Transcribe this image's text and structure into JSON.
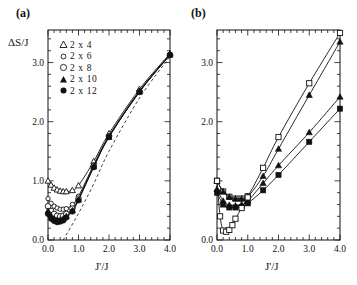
{
  "figure": {
    "background": "#ffffff",
    "ink": "#111111"
  },
  "panels": [
    {
      "id": "a",
      "label": "(a)",
      "ylabel": "ΔS/J",
      "xlabel": "J'/J"
    },
    {
      "id": "b",
      "label": "(b)",
      "ylabel": "",
      "xlabel": "J'/J"
    }
  ],
  "legend": {
    "items": [
      {
        "label": "2 x 4",
        "marker": "open-triangle",
        "series": "2x4"
      },
      {
        "label": "2 x 6",
        "marker": "open-circle-sm",
        "series": "2x6"
      },
      {
        "label": "2 x 8",
        "marker": "open-circle",
        "series": "2x8"
      },
      {
        "label": "2 x 10",
        "marker": "filled-triangle",
        "series": "2x10"
      },
      {
        "label": "2 x 12",
        "marker": "filled-circle",
        "series": "2x12"
      }
    ]
  },
  "axis_ticks": {
    "x_major": [
      "0.0",
      "1.0",
      "2.0",
      "3.0",
      "4.0"
    ],
    "y_major": [
      "0.0",
      "1.0",
      "2.0",
      "3.0"
    ]
  },
  "chart_data": [
    {
      "type": "line",
      "panel": "a",
      "title": "(a)",
      "xlabel": "J'/J",
      "ylabel": "ΔS/J",
      "xlim": [
        0.0,
        4.0
      ],
      "ylim": [
        0.0,
        3.55
      ],
      "xticks": [
        0.0,
        1.0,
        2.0,
        3.0,
        4.0
      ],
      "yticks": [
        0.0,
        1.0,
        2.0,
        3.0
      ],
      "xminor_step": 0.2,
      "yminor_step": 0.2,
      "grid": false,
      "legend_position": "upper-left",
      "series": [
        {
          "name": "2 x 4",
          "marker": "open-triangle",
          "x": [
            0.0,
            0.1,
            0.2,
            0.3,
            0.4,
            0.5,
            0.6,
            0.8,
            1.0,
            1.5,
            2.0,
            3.0,
            4.0
          ],
          "y": [
            1.0,
            0.93,
            0.88,
            0.85,
            0.83,
            0.82,
            0.82,
            0.84,
            0.92,
            1.33,
            1.8,
            2.55,
            3.15
          ]
        },
        {
          "name": "2 x 6",
          "marker": "open-circle-sm",
          "x": [
            0.0,
            0.1,
            0.2,
            0.3,
            0.4,
            0.5,
            0.6,
            0.8,
            1.0,
            1.5,
            2.0,
            3.0,
            4.0
          ],
          "y": [
            0.7,
            0.62,
            0.57,
            0.54,
            0.52,
            0.52,
            0.53,
            0.6,
            0.74,
            1.27,
            1.76,
            2.52,
            3.14
          ]
        },
        {
          "name": "2 x 8",
          "marker": "open-circle",
          "x": [
            0.0,
            0.1,
            0.2,
            0.3,
            0.4,
            0.5,
            0.6,
            0.8,
            1.0,
            1.5,
            2.0,
            3.0,
            4.0
          ],
          "y": [
            0.57,
            0.49,
            0.44,
            0.41,
            0.4,
            0.41,
            0.44,
            0.53,
            0.7,
            1.25,
            1.75,
            2.51,
            3.13
          ]
        },
        {
          "name": "2 x 10",
          "marker": "filled-triangle",
          "x": [
            0.0,
            0.1,
            0.2,
            0.3,
            0.4,
            0.5,
            0.6,
            0.8,
            1.0,
            1.5,
            2.0,
            3.0,
            4.0
          ],
          "y": [
            0.49,
            0.41,
            0.36,
            0.34,
            0.34,
            0.36,
            0.4,
            0.5,
            0.68,
            1.24,
            1.74,
            2.51,
            3.13
          ]
        },
        {
          "name": "2 x 12",
          "marker": "filled-circle",
          "x": [
            0.0,
            0.1,
            0.2,
            0.3,
            0.4,
            0.5,
            0.6,
            0.8,
            1.0,
            1.5,
            2.0,
            3.0,
            4.0
          ],
          "y": [
            0.44,
            0.36,
            0.32,
            0.3,
            0.31,
            0.33,
            0.38,
            0.48,
            0.67,
            1.23,
            1.74,
            2.5,
            3.13
          ]
        },
        {
          "name": "dashed-guide",
          "marker": "none",
          "style": "dashed",
          "x": [
            0.5,
            1.0,
            1.5,
            2.0,
            3.0,
            4.0
          ],
          "y": [
            0.0,
            0.45,
            0.95,
            1.5,
            2.4,
            3.1
          ]
        }
      ]
    },
    {
      "type": "line",
      "panel": "b",
      "title": "(b)",
      "xlabel": "J'/J",
      "ylabel": "",
      "xlim": [
        0.0,
        4.0
      ],
      "ylim": [
        0.0,
        3.55
      ],
      "xticks": [
        0.0,
        1.0,
        2.0,
        3.0,
        4.0
      ],
      "yticks": [
        0.0,
        1.0,
        2.0,
        3.0
      ],
      "xminor_step": 0.2,
      "yminor_step": 0.2,
      "grid": false,
      "legend_position": "none",
      "series": [
        {
          "name": "upper-open-square",
          "marker": "open-square",
          "x": [
            0.0,
            0.2,
            0.4,
            0.6,
            0.8,
            1.0,
            1.5,
            2.0,
            3.0,
            4.0
          ],
          "y": [
            1.0,
            0.82,
            0.73,
            0.7,
            0.7,
            0.74,
            1.22,
            1.74,
            2.65,
            3.5
          ]
        },
        {
          "name": "upper-filled-triangle",
          "marker": "filled-triangle",
          "x": [
            0.0,
            0.2,
            0.4,
            0.6,
            0.8,
            1.0,
            1.5,
            2.0,
            3.0,
            4.0
          ],
          "y": [
            1.0,
            0.82,
            0.73,
            0.7,
            0.7,
            0.73,
            1.08,
            1.54,
            2.45,
            3.35
          ]
        },
        {
          "name": "mid-filled-triangle",
          "marker": "filled-triangle",
          "x": [
            0.0,
            0.2,
            0.4,
            0.6,
            0.8,
            1.0,
            1.5,
            2.0,
            3.0,
            4.0
          ],
          "y": [
            0.86,
            0.66,
            0.59,
            0.58,
            0.6,
            0.66,
            0.96,
            1.26,
            1.82,
            2.42
          ]
        },
        {
          "name": "lower-filled-square",
          "marker": "filled-square",
          "x": [
            0.0,
            0.2,
            0.4,
            0.6,
            0.8,
            1.0,
            1.5,
            2.0,
            3.0,
            4.0
          ],
          "y": [
            0.8,
            0.6,
            0.55,
            0.55,
            0.56,
            0.62,
            0.84,
            1.1,
            1.66,
            2.22
          ]
        },
        {
          "name": "bottom-open-square",
          "marker": "open-square",
          "x": [
            0.0,
            0.1,
            0.2,
            0.3,
            0.4,
            0.5,
            0.6,
            0.8,
            1.0
          ],
          "y": [
            1.0,
            0.4,
            0.16,
            0.14,
            0.17,
            0.25,
            0.36,
            0.54,
            0.72
          ]
        }
      ]
    }
  ]
}
